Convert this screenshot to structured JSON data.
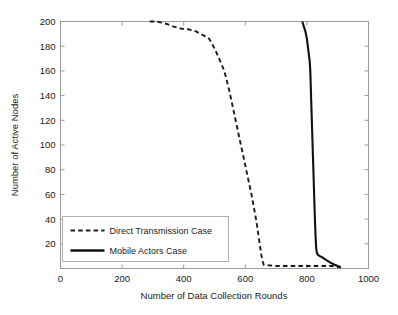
{
  "chart_data": {
    "type": "line",
    "title": "",
    "xlabel": "Number of Data Collection Rounds",
    "ylabel": "Number of Active Nodes",
    "xlim": [
      0,
      1000
    ],
    "ylim": [
      0,
      200
    ],
    "xticks": [
      0,
      200,
      400,
      600,
      800,
      1000
    ],
    "yticks": [
      20,
      40,
      60,
      80,
      100,
      120,
      140,
      160,
      180,
      200
    ],
    "xtick_labels": [
      "0",
      "200",
      "400",
      "600",
      "800",
      "1000"
    ],
    "ytick_labels": [
      "20",
      "40",
      "60",
      "80",
      "100",
      "120",
      "140",
      "160",
      "180",
      "200"
    ],
    "grid": false,
    "legend_position": "lower left",
    "series": [
      {
        "name": "Direct Transmission Case",
        "style": "dashed",
        "color": "#1a1a1a",
        "x": [
          290,
          310,
          330,
          345,
          355,
          365,
          380,
          395,
          410,
          425,
          440,
          455,
          470,
          480,
          490,
          500,
          508,
          515,
          522,
          530,
          536,
          542,
          548,
          554,
          560,
          566,
          572,
          578,
          584,
          590,
          596,
          602,
          608,
          614,
          620,
          626,
          632,
          638,
          643,
          648,
          652,
          656,
          660,
          700,
          750,
          800,
          850,
          880,
          910
        ],
        "y": [
          200,
          200,
          199,
          198,
          197,
          196,
          195,
          194,
          194,
          193,
          192,
          190,
          188,
          187,
          183,
          178,
          174,
          170,
          166,
          161,
          156,
          150,
          144,
          137,
          130,
          123,
          116,
          109,
          102,
          95,
          88,
          81,
          74,
          67,
          60,
          52,
          44,
          35,
          26,
          18,
          11,
          6,
          3,
          2,
          2,
          2,
          2,
          2,
          1
        ]
      },
      {
        "name": "Mobile Actors  Case",
        "style": "solid",
        "color": "#111111",
        "x": [
          785,
          790,
          795,
          800,
          803,
          806,
          809,
          811,
          812,
          813,
          814,
          815,
          816,
          817,
          818,
          819,
          820,
          821,
          822,
          823,
          824,
          825,
          826,
          827,
          828,
          829,
          830,
          832,
          836,
          842,
          850,
          862,
          875,
          890,
          900,
          910
        ],
        "y": [
          200,
          196,
          192,
          186,
          180,
          174,
          168,
          160,
          152,
          144,
          136,
          128,
          120,
          112,
          104,
          96,
          88,
          80,
          72,
          64,
          56,
          48,
          40,
          33,
          27,
          22,
          17,
          13,
          11,
          10,
          9,
          7,
          5,
          3,
          2,
          1
        ]
      }
    ],
    "legend": [
      {
        "label": "Direct Transmission Case",
        "style": "dashed"
      },
      {
        "label": "Mobile Actors  Case",
        "style": "solid"
      }
    ]
  }
}
